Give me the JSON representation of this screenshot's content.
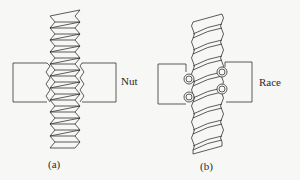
{
  "figure": {
    "panels": [
      {
        "id": "a",
        "caption": "(a)",
        "component_label": "Nut",
        "description": "Threaded screw passing through a nut"
      },
      {
        "id": "b",
        "caption": "(b)",
        "component_label": "Race",
        "description": "Ball screw with recirculating balls in a race"
      }
    ]
  },
  "colors": {
    "stroke": "#333333",
    "background": "#f7f7f5",
    "fill": "#ffffff"
  }
}
